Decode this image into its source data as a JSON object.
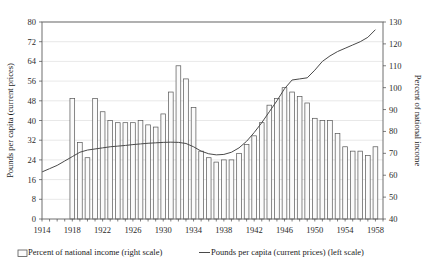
{
  "chart_data": {
    "type": "bar",
    "title": "",
    "xlabel": "",
    "ylabel": "Pounds per capita (current prices)",
    "y2label": "Percent of national income",
    "ylim": [
      0,
      80
    ],
    "y2lim": [
      40,
      130
    ],
    "xlim": [
      1914,
      1959
    ],
    "grid": true,
    "legend_position": "bottom",
    "y_ticks": [
      0,
      8,
      16,
      24,
      32,
      40,
      48,
      56,
      64,
      72,
      80
    ],
    "y2_ticks": [
      40,
      50,
      60,
      70,
      80,
      90,
      100,
      110,
      120,
      130
    ],
    "x_ticks": [
      1914,
      1918,
      1922,
      1926,
      1930,
      1934,
      1938,
      1942,
      1946,
      1950,
      1954,
      1958
    ],
    "x_minor_step": 1,
    "series": [
      {
        "name": "Percent of national income (right scale)",
        "type": "bar",
        "axis": "right",
        "color": "#fbfbfb",
        "edge_color": "#555555",
        "x": [
          1914,
          1915,
          1916,
          1917,
          1918,
          1919,
          1920,
          1921,
          1922,
          1923,
          1924,
          1925,
          1926,
          1927,
          1928,
          1929,
          1930,
          1931,
          1932,
          1933,
          1934,
          1935,
          1936,
          1937,
          1938,
          1939,
          1940,
          1941,
          1942,
          1943,
          1944,
          1945,
          1946,
          1947,
          1948,
          1949,
          1950,
          1951,
          1952,
          1953,
          1954,
          1955,
          1956,
          1957,
          1958
        ],
        "values": [
          null,
          null,
          null,
          null,
          95,
          75,
          68,
          95,
          89,
          85,
          84,
          84,
          84,
          85,
          83,
          82,
          88,
          98,
          110,
          104,
          91,
          71,
          68,
          66,
          67,
          67,
          70,
          74,
          78,
          84,
          92,
          95,
          100,
          98,
          96,
          93,
          86,
          85,
          85,
          79,
          73,
          71,
          71,
          69,
          73
        ]
      },
      {
        "name": "Pounds per capita (current prices) (left scale)",
        "type": "line",
        "axis": "left",
        "color": "#4a4a4a",
        "x": [
          1914,
          1915,
          1916,
          1917,
          1918,
          1919,
          1920,
          1921,
          1922,
          1923,
          1924,
          1925,
          1926,
          1927,
          1928,
          1929,
          1930,
          1931,
          1932,
          1933,
          1934,
          1935,
          1936,
          1937,
          1938,
          1939,
          1940,
          1941,
          1942,
          1943,
          1944,
          1945,
          1946,
          1947,
          1948,
          1949,
          1950,
          1951,
          1952,
          1953,
          1954,
          1955,
          1956,
          1957,
          1958
        ],
        "y2_values": [
          61.5,
          63.0,
          64.5,
          66.5,
          68.5,
          70.5,
          71.5,
          72.0,
          72.5,
          73.0,
          73.3,
          73.6,
          74.0,
          74.3,
          74.6,
          74.8,
          75.0,
          75.1,
          75.0,
          74.5,
          73.0,
          71.0,
          69.8,
          69.3,
          69.5,
          70.5,
          72.5,
          75.5,
          79.5,
          84.0,
          89.0,
          94.0,
          99.5,
          103.5,
          104.0,
          104.5,
          108.0,
          112.0,
          114.5,
          116.5,
          118.0,
          119.5,
          121.0,
          123.0,
          126.5
        ]
      }
    ]
  },
  "legend": {
    "items": [
      {
        "label": "Percent of national income (right scale)",
        "marker": "bar-swatch"
      },
      {
        "label": "Pounds per capita (current prices) (left scale)",
        "marker": "line-swatch"
      }
    ]
  },
  "axes": {
    "left_title": "Pounds per capita (current prices)",
    "right_title": "Percent of national income"
  }
}
